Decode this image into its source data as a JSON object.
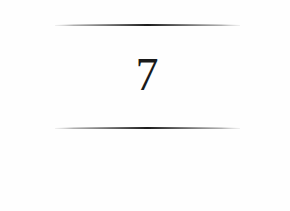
{
  "chapter": {
    "number": "7"
  },
  "colors": {
    "rule": "#1c1c1c",
    "text": "#1a1a1a",
    "background": "#fefefe"
  }
}
